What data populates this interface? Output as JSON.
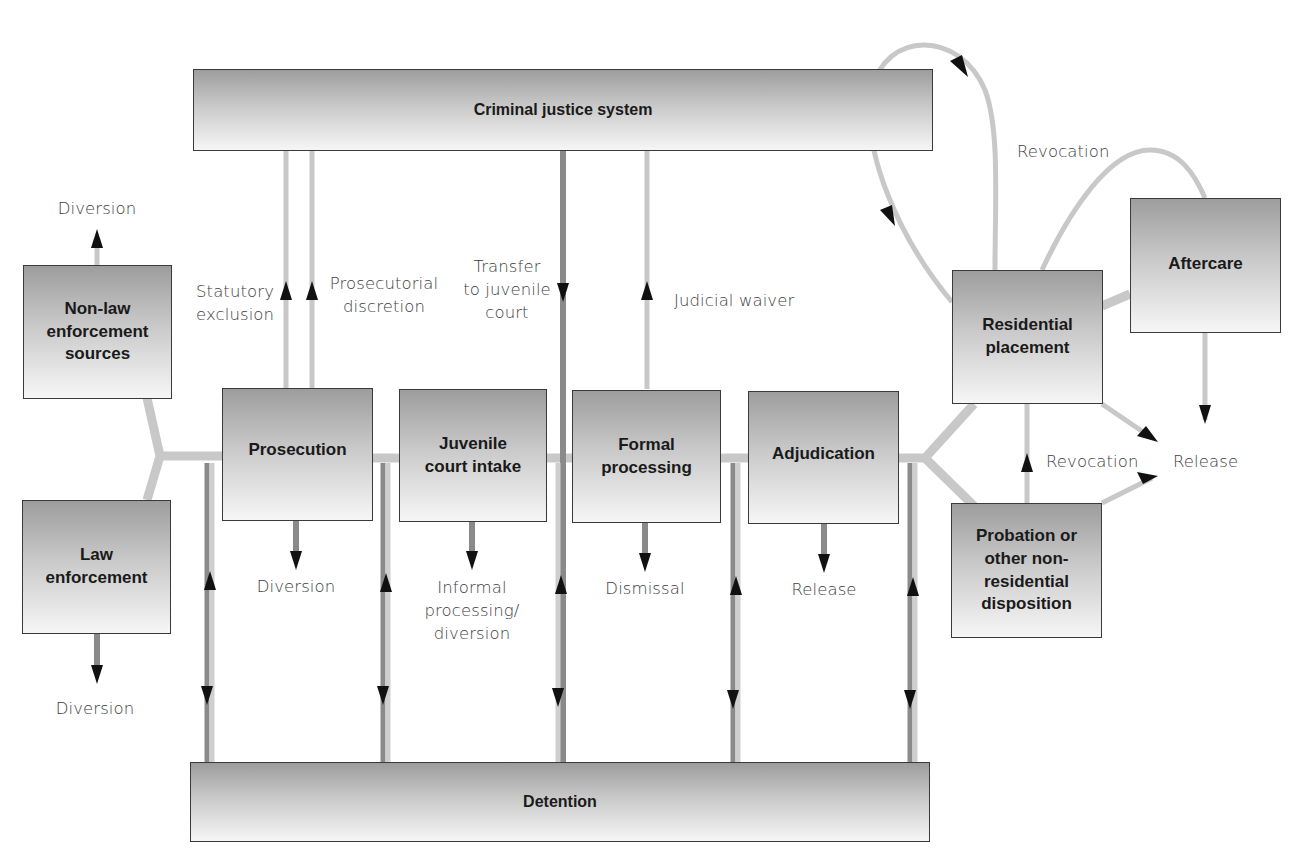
{
  "diagram": {
    "type": "flowchart",
    "nodes": {
      "criminal_justice_system": "Criminal justice system",
      "non_law_enforcement": "Non-law\nenforcement\nsources",
      "law_enforcement": "Law\nenforcement",
      "prosecution": "Prosecution",
      "juvenile_court_intake": "Juvenile\ncourt intake",
      "formal_processing": "Formal\nprocessing",
      "adjudication": "Adjudication",
      "residential_placement": "Residential\nplacement",
      "aftercare": "Aftercare",
      "probation": "Probation or\nother non-\nresidential\ndisposition",
      "detention": "Detention"
    },
    "labels": {
      "diversion_top": "Diversion",
      "diversion_bottom": "Diversion",
      "statutory_exclusion": "Statutory\nexclusion",
      "prosecutorial_discretion": "Prosecutorial\ndiscretion",
      "transfer_to_juvenile_court": "Transfer\nto juvenile\ncourt",
      "judicial_waiver": "Judicial waiver",
      "prosecution_diversion": "Diversion",
      "informal_processing": "Informal\nprocessing/\ndiversion",
      "dismissal": "Dismissal",
      "adjudication_release": "Release",
      "revocation_top": "Revocation",
      "revocation_mid": "Revocation",
      "release_right": "Release"
    },
    "edges": [
      {
        "from": "non_law_enforcement",
        "to": "diversion_top"
      },
      {
        "from": "law_enforcement",
        "to": "diversion_bottom"
      },
      {
        "from": "non_law_enforcement",
        "to": "prosecution"
      },
      {
        "from": "law_enforcement",
        "to": "prosecution"
      },
      {
        "from": "prosecution",
        "to": "criminal_justice_system",
        "label": "Statutory exclusion"
      },
      {
        "from": "prosecution",
        "to": "criminal_justice_system",
        "label": "Prosecutorial discretion"
      },
      {
        "from": "criminal_justice_system",
        "to": "formal_processing",
        "label": "Transfer to juvenile court"
      },
      {
        "from": "formal_processing",
        "to": "criminal_justice_system",
        "label": "Judicial waiver"
      },
      {
        "from": "prosecution",
        "to": "juvenile_court_intake"
      },
      {
        "from": "juvenile_court_intake",
        "to": "formal_processing"
      },
      {
        "from": "formal_processing",
        "to": "adjudication"
      },
      {
        "from": "prosecution",
        "to": "prosecution_diversion",
        "label": "Diversion"
      },
      {
        "from": "juvenile_court_intake",
        "to": "informal_processing",
        "label": "Informal processing/diversion"
      },
      {
        "from": "formal_processing",
        "to": "dismissal",
        "label": "Dismissal"
      },
      {
        "from": "adjudication",
        "to": "adjudication_release",
        "label": "Release"
      },
      {
        "from": "adjudication",
        "to": "residential_placement"
      },
      {
        "from": "adjudication",
        "to": "probation"
      },
      {
        "from": "residential_placement",
        "to": "aftercare"
      },
      {
        "from": "residential_placement",
        "to": "criminal_justice_system"
      },
      {
        "from": "criminal_justice_system",
        "to": "residential_placement"
      },
      {
        "from": "aftercare",
        "to": "residential_placement",
        "label": "Revocation"
      },
      {
        "from": "probation",
        "to": "residential_placement",
        "label": "Revocation"
      },
      {
        "from": "residential_placement",
        "to": "release_right",
        "label": "Release"
      },
      {
        "from": "probation",
        "to": "release_right",
        "label": "Release"
      },
      {
        "from": "aftercare",
        "to": "release_right",
        "label": "Release"
      },
      {
        "from": "detention",
        "to": "flow",
        "bidirectional": true,
        "count": 5
      }
    ]
  },
  "colors": {
    "box_border": "#3a3a3a",
    "box_gradient_top": "#9d9d9d",
    "box_gradient_bottom": "#f6f6f6",
    "connector_light": "#c8c8c8",
    "connector_dark": "#8a8a8a",
    "arrowhead": "#111111",
    "label_text": "#3e3e3e"
  }
}
